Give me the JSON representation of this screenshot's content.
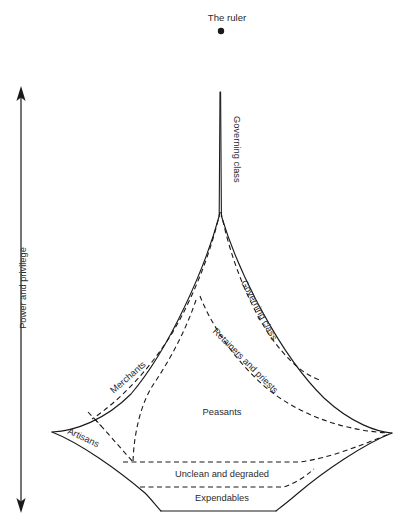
{
  "figure": {
    "type": "diagram",
    "subtype": "lenski-social-stratification-diamond",
    "background_color": "#ffffff",
    "line_color": "#1a1a1a",
    "text_color": "#2b2b2b",
    "width": 403,
    "height": 525
  },
  "title": {
    "text": "The ruler",
    "x": 227,
    "y": 17
  },
  "ruler_dot": {
    "name": "ruler-dot",
    "cx": 221,
    "cy": 31,
    "r": 3.2
  },
  "axis": {
    "label": "Power and privilege",
    "arrow_top_y": 88,
    "arrow_bottom_y": 512,
    "x": 21,
    "double_headed": true,
    "label_x": 24,
    "label_y": 288
  },
  "strata": [
    {
      "id": "governing-class-spire",
      "label": "Governing class",
      "orientation": "vertical-down",
      "label_x": 236,
      "label_y": 116,
      "rotation": 90
    },
    {
      "id": "governing-class-band",
      "label": "Governing class",
      "orientation": "diagonal",
      "label_x": 243,
      "label_y": 280,
      "rotation": 62
    },
    {
      "id": "retainers-and-priests",
      "label": "Retainers and priests",
      "orientation": "diagonal",
      "label_x": 222,
      "label_y": 332,
      "rotation": 45
    },
    {
      "id": "merchants",
      "label": "Merchants",
      "orientation": "diagonal",
      "label_x": 124,
      "label_y": 388,
      "rotation": -41
    },
    {
      "id": "artisans",
      "label": "Artisans",
      "orientation": "diagonal",
      "label_x": 73,
      "label_y": 433,
      "rotation": 25
    },
    {
      "id": "peasants",
      "label": "Peasants",
      "orientation": "horizontal",
      "label_x": 222,
      "label_y": 413,
      "rotation": 0
    },
    {
      "id": "unclean-and-degraded",
      "label": "Unclean and degraded",
      "orientation": "horizontal",
      "label_x": 222,
      "label_y": 475,
      "rotation": 0
    },
    {
      "id": "expendables",
      "label": "Expendables",
      "orientation": "horizontal",
      "label_x": 222,
      "label_y": 498,
      "rotation": 0
    }
  ],
  "geometry": {
    "apex": {
      "x": 220,
      "y": 92
    },
    "spire_base_y": 218,
    "left_tip": {
      "x": 52,
      "y": 432
    },
    "right_tip": {
      "x": 392,
      "y": 433
    },
    "bottom_left": {
      "x": 161,
      "y": 511
    },
    "bottom_right": {
      "x": 276,
      "y": 511
    }
  }
}
